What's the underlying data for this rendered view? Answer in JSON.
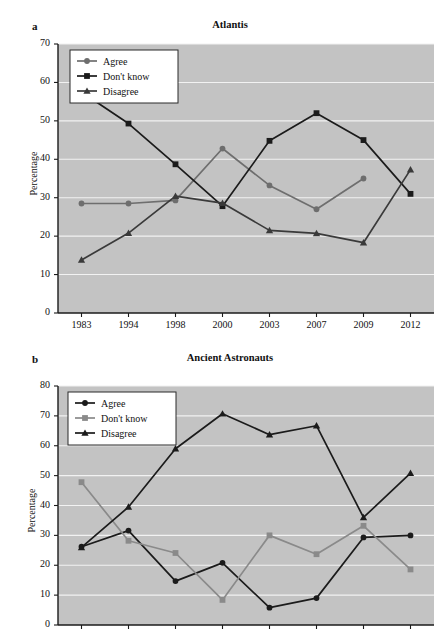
{
  "figure": {
    "ylabel": "Percentage",
    "background": "#c3c3c3",
    "gridcolor": "#f2f2f2",
    "colors": {
      "dark": "#1b1b1b",
      "gray": "#6e6e6e",
      "midgray": "#8a8a8a"
    }
  },
  "panels": [
    {
      "letter": "a",
      "title": "Atlantis",
      "ylabel": "Percentage",
      "legend_position": "top-left",
      "yticks": [
        0,
        10,
        20,
        30,
        40,
        50,
        60,
        70
      ],
      "xticks": [
        "1983",
        "1994",
        "1998",
        "2000",
        "2003",
        "2007",
        "2009",
        "2012"
      ],
      "show_xticklabels": true,
      "legend": [
        {
          "label": "Agree",
          "marker": "circle",
          "color": "#6e6e6e"
        },
        {
          "label": "Don't know",
          "marker": "square",
          "color": "#1b1b1b"
        },
        {
          "label": "Disagree",
          "marker": "triangle",
          "color": "#3a3a3a"
        }
      ]
    },
    {
      "letter": "b",
      "title": "Ancient Astronauts",
      "ylabel": "Percentage",
      "legend_position": "top-left",
      "yticks": [
        0,
        10,
        20,
        30,
        40,
        50,
        60,
        70,
        80
      ],
      "xticks": [
        "",
        "",
        "",
        "",
        "",
        "",
        "",
        ""
      ],
      "show_xticklabels": false,
      "legend": [
        {
          "label": "Agree",
          "marker": "circle",
          "color": "#1b1b1b"
        },
        {
          "label": "Don't know",
          "marker": "square",
          "color": "#8a8a8a"
        },
        {
          "label": "Disagree",
          "marker": "triangle",
          "color": "#1b1b1b"
        }
      ]
    }
  ],
  "chart_data": [
    {
      "type": "line",
      "panel": "a",
      "title": "Atlantis",
      "xlabel": "",
      "ylabel": "Percentage",
      "categories": [
        "1983",
        "1994",
        "1998",
        "2000",
        "2003",
        "2007",
        "2009",
        "2012"
      ],
      "ylim": [
        0,
        70
      ],
      "ytick_step": 10,
      "grid": true,
      "legend_position": "top-left",
      "series": [
        {
          "name": "Agree",
          "marker": "circle",
          "color": "#6e6e6e",
          "values": [
            28.5,
            28.5,
            29.3,
            42.8,
            33.2,
            27.0,
            35.0,
            null
          ]
        },
        {
          "name": "Don't know",
          "marker": "square",
          "color": "#1b1b1b",
          "values": [
            57.5,
            49.3,
            38.7,
            27.8,
            44.8,
            52.0,
            45.0,
            31.0
          ]
        },
        {
          "name": "Disagree",
          "marker": "triangle",
          "color": "#3a3a3a",
          "values": [
            13.8,
            20.8,
            30.4,
            28.6,
            21.5,
            20.7,
            18.3,
            37.3
          ]
        }
      ]
    },
    {
      "type": "line",
      "panel": "b",
      "title": "Ancient Astronauts",
      "xlabel": "",
      "ylabel": "Percentage",
      "categories": [
        "1",
        "2",
        "3",
        "4",
        "5",
        "6",
        "7",
        "8"
      ],
      "ylim": [
        0,
        80
      ],
      "ytick_step": 10,
      "grid": true,
      "legend_position": "top-left",
      "series": [
        {
          "name": "Agree",
          "marker": "circle",
          "color": "#1b1b1b",
          "values": [
            26.2,
            31.6,
            14.7,
            20.8,
            5.8,
            9.0,
            29.3,
            30.0
          ]
        },
        {
          "name": "Don't know",
          "marker": "square",
          "color": "#8a8a8a",
          "values": [
            47.8,
            28.2,
            24.1,
            8.4,
            30.0,
            23.7,
            33.2,
            18.6
          ]
        },
        {
          "name": "Disagree",
          "marker": "triangle",
          "color": "#1b1b1b",
          "values": [
            26.0,
            39.5,
            59.0,
            70.7,
            63.7,
            66.7,
            36.0,
            50.8
          ]
        }
      ]
    }
  ]
}
